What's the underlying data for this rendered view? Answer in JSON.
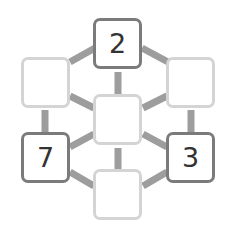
{
  "puzzle": {
    "colors": {
      "link": "#9d9d9d",
      "given_border": "#7b7b7b",
      "empty_border": "#d4d4d4",
      "text": "#333333"
    },
    "nodes": [
      {
        "id": "top",
        "value": "2",
        "given": true
      },
      {
        "id": "upper-left",
        "value": "",
        "given": false
      },
      {
        "id": "upper-right",
        "value": "",
        "given": false
      },
      {
        "id": "center",
        "value": "",
        "given": false
      },
      {
        "id": "lower-left",
        "value": "7",
        "given": true
      },
      {
        "id": "lower-right",
        "value": "3",
        "given": true
      },
      {
        "id": "bottom",
        "value": "",
        "given": false
      }
    ]
  }
}
